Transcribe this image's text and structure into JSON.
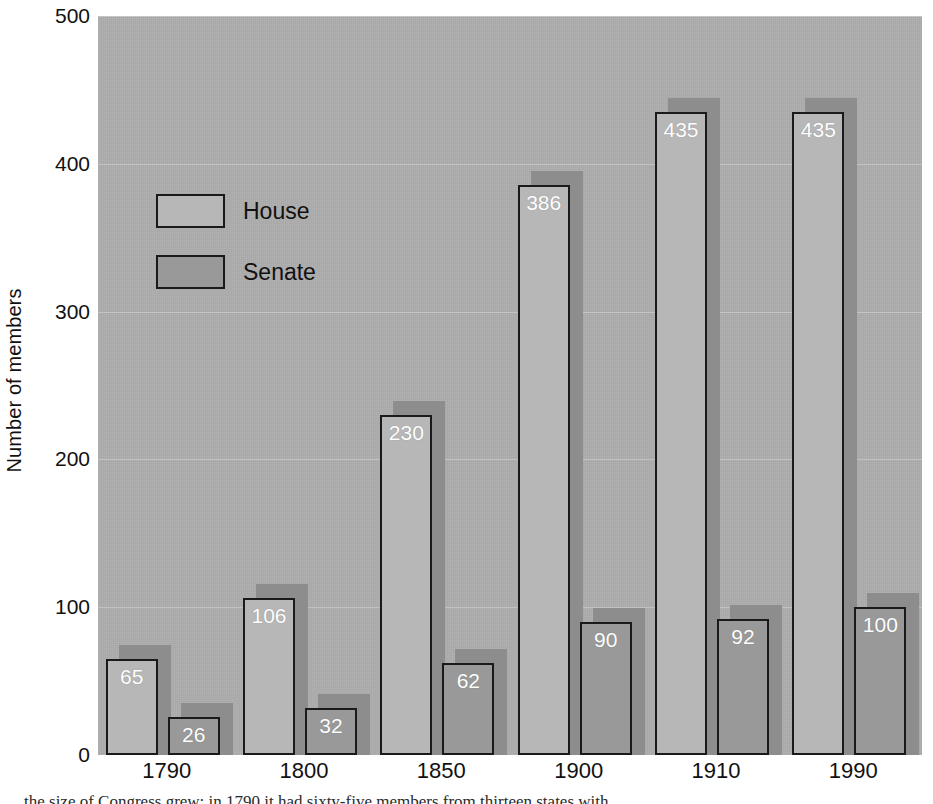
{
  "chart_data": {
    "type": "bar",
    "title": "",
    "xlabel": "",
    "ylabel": "Number of members",
    "categories": [
      "1790",
      "1800",
      "1850",
      "1900",
      "1910",
      "1990"
    ],
    "series": [
      {
        "name": "House",
        "values": [
          65,
          106,
          230,
          386,
          435,
          435
        ]
      },
      {
        "name": "Senate",
        "values": [
          26,
          32,
          62,
          90,
          92,
          100
        ]
      }
    ],
    "ylim": [
      0,
      500
    ],
    "yticks": [
      0,
      100,
      200,
      300,
      400,
      500
    ],
    "ytick_labels": [
      "0",
      "100",
      "200",
      "300",
      "400",
      "500"
    ],
    "grid": true,
    "legend_position": "upper-left-inside",
    "data_labels": true
  },
  "legend": {
    "items": [
      {
        "label": "House",
        "swatch": "house-swatch"
      },
      {
        "label": "Senate",
        "swatch": "senate-swatch"
      }
    ]
  },
  "colors": {
    "plot_background": "#aeaeae",
    "house_fill": "#b7b7b7",
    "senate_fill": "#999999",
    "bar_outline": "#1a1a1a",
    "shadow": "#8d8d8d",
    "gridline": "#ffffff",
    "label_text": "#ffffff",
    "axis_text": "#111111",
    "page_background": "#ffffff"
  },
  "caption": {
    "partial_line": "the size of Congress grew: in 1790 it had sixty-five members from thirteen states with"
  }
}
